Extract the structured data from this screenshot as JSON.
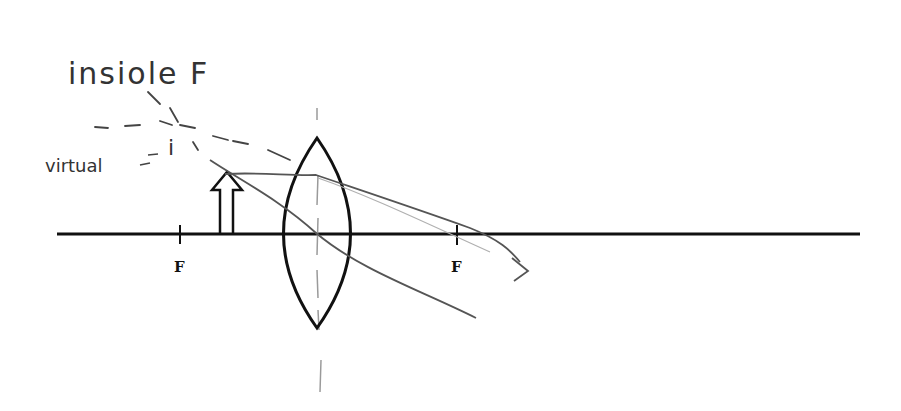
{
  "diagram": {
    "annotations": {
      "inside_f": "insiole F",
      "virtual": "virtual",
      "image_mark": "i"
    },
    "labels": {
      "focal_left": "F",
      "focal_right": "F"
    },
    "elements": {
      "optical_axis": "horizontal principal axis",
      "lens": "biconvex converging lens",
      "object": "upright hollow arrow between F and lens",
      "rays": "hand-drawn refracted rays with dashed virtual extensions"
    },
    "colors": {
      "printed_ink": "#111111",
      "pencil": "#555555",
      "pencil_light": "#9a9a9a"
    }
  }
}
